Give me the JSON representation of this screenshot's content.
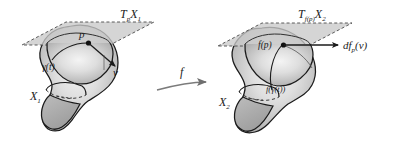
{
  "figure": {
    "background_color": "#ffffff",
    "ink_color": "#1b1b1b",
    "plane_fill": "#c9c9c9",
    "blob_fill_light": "#f0f0f0",
    "blob_fill_mid": "#c4c4c4",
    "blob_fill_dark": "#a8a8a8",
    "lobe_fill": "#adadad"
  },
  "left": {
    "tangent_plane_label": "T",
    "tangent_plane_sub": "p",
    "tangent_plane_space": "X",
    "tangent_plane_space_sub": "1",
    "point_label": "p",
    "curve_label": "γ(t)",
    "vector_label": "v",
    "manifold_label": "X",
    "manifold_sub": "1"
  },
  "map": {
    "label": "f"
  },
  "right": {
    "tangent_plane_label": "T",
    "tangent_plane_sub": "f(p)",
    "tangent_plane_space": "X",
    "tangent_plane_space_sub": "2",
    "point_label": "f(p)",
    "curve_label": "f(γ(t))",
    "vector_label": "df",
    "vector_sub": "p",
    "vector_arg": "(v)",
    "manifold_label": "X",
    "manifold_sub": "2"
  }
}
